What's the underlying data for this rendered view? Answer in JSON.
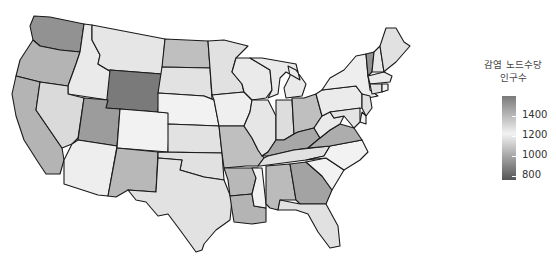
{
  "chart_data": {
    "type": "choropleth",
    "title": "",
    "legend": {
      "title_line1": "감염 노드수당",
      "title_line2": "인구수",
      "ticks": [
        "1400",
        "1200",
        "1000",
        "800"
      ],
      "range": [
        750,
        1500
      ],
      "placement": "right",
      "colors": {
        "low": "#555555",
        "mid": "#f2f2f2",
        "high": "#7a7a7a"
      }
    },
    "states": [
      {
        "id": "WA",
        "value": 1430
      },
      {
        "id": "OR",
        "value": 1330
      },
      {
        "id": "CA",
        "value": 1330
      },
      {
        "id": "ID",
        "value": 1130
      },
      {
        "id": "NV",
        "value": 1220
      },
      {
        "id": "MT",
        "value": 1120
      },
      {
        "id": "WY",
        "value": 1500
      },
      {
        "id": "UT",
        "value": 1400
      },
      {
        "id": "AZ",
        "value": 1140
      },
      {
        "id": "CO",
        "value": 1150
      },
      {
        "id": "NM",
        "value": 1320
      },
      {
        "id": "ND",
        "value": 1300
      },
      {
        "id": "SD",
        "value": 1110
      },
      {
        "id": "NE",
        "value": 1150
      },
      {
        "id": "KS",
        "value": 1110
      },
      {
        "id": "OK",
        "value": 1200
      },
      {
        "id": "TX",
        "value": 1110
      },
      {
        "id": "MN",
        "value": 1200
      },
      {
        "id": "IA",
        "value": 1160
      },
      {
        "id": "MO",
        "value": 1300
      },
      {
        "id": "AR",
        "value": 1320
      },
      {
        "id": "LA",
        "value": 1330
      },
      {
        "id": "WI",
        "value": 1130
      },
      {
        "id": "IL",
        "value": 1120
      },
      {
        "id": "MI",
        "value": 1130
      },
      {
        "id": "IN",
        "value": 1210
      },
      {
        "id": "OH",
        "value": 1300
      },
      {
        "id": "KY",
        "value": 1370
      },
      {
        "id": "TN",
        "value": 1200
      },
      {
        "id": "MS",
        "value": 1150
      },
      {
        "id": "AL",
        "value": 1310
      },
      {
        "id": "GA",
        "value": 1380
      },
      {
        "id": "FL",
        "value": 1200
      },
      {
        "id": "SC",
        "value": 1150
      },
      {
        "id": "NC",
        "value": 1150
      },
      {
        "id": "VA",
        "value": 1350
      },
      {
        "id": "WV",
        "value": 1130
      },
      {
        "id": "PA",
        "value": 1170
      },
      {
        "id": "NY",
        "value": 1140
      },
      {
        "id": "VT",
        "value": 1430
      },
      {
        "id": "NH",
        "value": 1180
      },
      {
        "id": "ME",
        "value": 1200
      },
      {
        "id": "MA",
        "value": 1170
      },
      {
        "id": "CT",
        "value": 1200
      },
      {
        "id": "RI",
        "value": 1150
      },
      {
        "id": "NJ",
        "value": 1200
      },
      {
        "id": "DE",
        "value": 1150
      },
      {
        "id": "MD",
        "value": 1190
      }
    ]
  }
}
